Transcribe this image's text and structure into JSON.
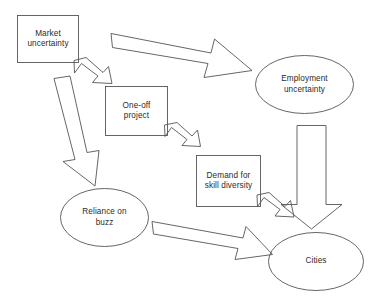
{
  "diagram": {
    "type": "flowchart",
    "background_color": "#ffffff",
    "stroke_color": "#555555",
    "text_color": "#2b2b2b",
    "nodes": [
      {
        "id": "market-uncertainty",
        "shape": "rectangle",
        "label": "Market\nuncertainty",
        "x": 17,
        "y": 15,
        "width": 62,
        "height": 48
      },
      {
        "id": "one-off-project",
        "shape": "rectangle",
        "label": "One-off\nproject",
        "x": 105,
        "y": 86,
        "width": 63,
        "height": 50
      },
      {
        "id": "demand-for-skill-diversity",
        "shape": "rectangle",
        "label": "Demand for\nskill diversity",
        "x": 196,
        "y": 155,
        "width": 65,
        "height": 52
      },
      {
        "id": "employment-uncertainty",
        "shape": "ellipse",
        "label": "Employment\nuncertainty",
        "x": 255,
        "y": 55,
        "width": 99,
        "height": 59
      },
      {
        "id": "reliance-on-buzz",
        "shape": "ellipse",
        "label": "Reliance on\nbuzz",
        "x": 60,
        "y": 188,
        "width": 89,
        "height": 59
      },
      {
        "id": "cities",
        "shape": "ellipse",
        "label": "Cities",
        "x": 268,
        "y": 232,
        "width": 96,
        "height": 59
      }
    ],
    "arrows": [
      {
        "id": "market-to-employment",
        "from": "market-uncertainty",
        "to": "employment-uncertainty",
        "style": "block-arrow-large",
        "direction": "right-down"
      },
      {
        "id": "market-to-one-off-project",
        "from": "market-uncertainty",
        "to": "one-off-project",
        "style": "block-arrow-small",
        "direction": "down-left"
      },
      {
        "id": "market-to-reliance-on-buzz",
        "from": "market-uncertainty",
        "to": "reliance-on-buzz",
        "style": "block-arrow-large",
        "direction": "down"
      },
      {
        "id": "one-off-project-to-demand",
        "from": "one-off-project",
        "to": "demand-for-skill-diversity",
        "style": "block-arrow-small",
        "direction": "down-left"
      },
      {
        "id": "employment-to-cities",
        "from": "employment-uncertainty",
        "to": "cities",
        "style": "block-arrow-large",
        "direction": "down"
      },
      {
        "id": "demand-to-cities",
        "from": "demand-for-skill-diversity",
        "to": "cities",
        "style": "block-arrow-small",
        "direction": "down-left"
      },
      {
        "id": "reliance-on-buzz-to-cities",
        "from": "reliance-on-buzz",
        "to": "cities",
        "style": "block-arrow-large",
        "direction": "right-down"
      }
    ]
  }
}
